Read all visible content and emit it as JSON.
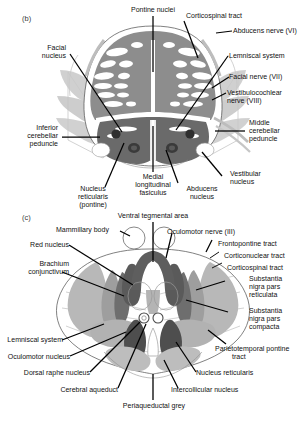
{
  "figure": {
    "type": "anatomical-cross-section-diagram",
    "panels": [
      {
        "id": "b",
        "tag": "(b)",
        "region": "pons",
        "labels": [
          "Pontine nuclei",
          "Corticospinal tract",
          "Abducens nerve (VI)",
          "Facial nucleus",
          "Lemniscal system",
          "Facial nerve (VII)",
          "Vestibulocochlear nerve (VIII)",
          "Inferior cerebellar peduncle",
          "Middle cerebellar peduncle",
          "Nucleus reticularis (pontine)",
          "Medial longitudinal fasiculus",
          "Abducens nucleus",
          "Vestibular nucleus"
        ]
      },
      {
        "id": "c",
        "tag": "(c)",
        "region": "midbrain",
        "labels": [
          "Ventral tegmental area",
          "Mammillary body",
          "Oculomotor nerve (III)",
          "Frontopontine tract",
          "Corticonuclear tract",
          "Corticospinal tract",
          "Red nucleus",
          "Brachium conjunctivum",
          "Substantia nigra pars reticulata",
          "Substantia nigra pars compacta",
          "Parietotemporal pontine tract",
          "Lemniscal system",
          "Oculomotor nucleus",
          "Dorsal raphe nucleus",
          "Cerebral aqueduct",
          "Nucleus reticularis",
          "Intercollicular nucleus",
          "Periaqueductal grey"
        ]
      }
    ],
    "palette": {
      "outline": "#4a4a4a",
      "basis_pontis": "#8d8d8d",
      "tegmentum_dark": "#6a6a6a",
      "nucleus_dark": "#3f3f3f",
      "fiber_light": "#c3c3c3",
      "fiber_mid": "#b0b0b0",
      "white_matter": "#ffffff",
      "leader_line": "#000000",
      "text": "#111111"
    }
  },
  "panel_b": {
    "tag": "(b)",
    "pontine_nuclei": "Pontine nuclei",
    "corticospinal_tract": "Corticospinal tract",
    "abducens_nerve": "Abducens nerve (VI)",
    "facial_nucleus_1": "Facial",
    "facial_nucleus_2": "nucleus",
    "lemniscal_system": "Lemniscal system",
    "facial_nerve": "Facial nerve (VII)",
    "vestibulocochlear_1": "Vestibulocochlear",
    "vestibulocochlear_2": "nerve (VIII)",
    "inferior_cp_1": "Inferior",
    "inferior_cp_2": "cerebellar",
    "inferior_cp_3": "peduncle",
    "middle_cp_1": "Middle",
    "middle_cp_2": "cerebellar",
    "middle_cp_3": "peduncle",
    "nucleus_reticularis_1": "Nucleus",
    "nucleus_reticularis_2": "reticularis",
    "nucleus_reticularis_3": "(pontine)",
    "mlf_1": "Medial",
    "mlf_2": "longitudinal",
    "mlf_3": "fasiculus",
    "abducens_nucleus_1": "Abducens",
    "abducens_nucleus_2": "nucleus",
    "vestibular_nucleus_1": "Vestibular",
    "vestibular_nucleus_2": "nucleus"
  },
  "panel_c": {
    "tag": "(c)",
    "ventral_tegmental_area": "Ventral tegmental area",
    "mammillary_body": "Mammillary body",
    "oculomotor_nerve": "Oculomotor nerve (III)",
    "frontopontine_tract": "Frontopontine tract",
    "corticonuclear_tract": "Corticonuclear tract",
    "corticospinal_tract": "Corticospinal tract",
    "red_nucleus": "Red nucleus",
    "brachium_1": "Brachium",
    "brachium_2": "conjunctivum",
    "snpr_1": "Substantia",
    "snpr_2": "nigra pars",
    "snpr_3": "reticulata",
    "snpc_1": "Substantia",
    "snpc_2": "nigra pars",
    "snpc_3": "compacta",
    "parietotemporal_1": "Parietotemporal pontine",
    "parietotemporal_2": "tract",
    "lemniscal_system": "Lemniscal system",
    "oculomotor_nucleus": "Oculomotor nucleus",
    "dorsal_raphe_nucleus": "Dorsal raphe nucleus",
    "cerebral_aqueduct": "Cerebral aqueduct",
    "nucleus_reticularis": "Nucleus reticularis",
    "intercollicular_nucleus": "Intercollicular nucleus",
    "periaqueductal_grey": "Periaqueductal grey"
  }
}
